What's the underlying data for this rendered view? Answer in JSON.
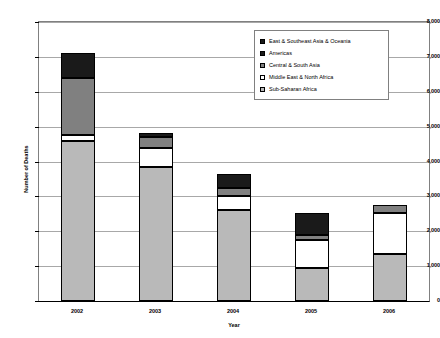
{
  "chart_data": {
    "type": "bar",
    "subtype": "stacked-vertical-bar",
    "title": "",
    "xlabel": "Year",
    "ylabel": "Number of Deaths",
    "categories": [
      "2002",
      "2003",
      "2004",
      "2005",
      "2006"
    ],
    "ylim": [
      0,
      8000
    ],
    "ytick_values": [
      0,
      1000,
      2000,
      3000,
      4000,
      5000,
      6000,
      7000,
      8000
    ],
    "ytick_labels": [
      "0",
      "1,000",
      "2,000",
      "3,000",
      "4,000",
      "5,000",
      "6,000",
      "7,000",
      "8,000"
    ],
    "grid": true,
    "grid_axis": "y",
    "legend_position": "inside-top-right",
    "stack_order_bottom_to_top": [
      "Sub-Saharan Africa",
      "Middle East & North Africa",
      "Central & South Asia",
      "Americas",
      "East & Southeast Asia & Oceania"
    ],
    "series": [
      {
        "name": "East & Southeast Asia & Oceania",
        "fill": "black",
        "values": [
          700,
          120,
          400,
          620,
          0
        ]
      },
      {
        "name": "Americas",
        "fill": "black",
        "values": [
          0,
          0,
          0,
          0,
          0
        ]
      },
      {
        "name": "Central & South Asia",
        "fill": "gray",
        "values": [
          1650,
          300,
          250,
          140,
          220
        ]
      },
      {
        "name": "Middle East & North Africa",
        "fill": "white",
        "values": [
          170,
          560,
          400,
          810,
          1170
        ]
      },
      {
        "name": "Sub-Saharan Africa",
        "fill": "speckle",
        "values": [
          4580,
          3840,
          2600,
          950,
          1350
        ]
      }
    ],
    "totals": [
      7100,
      4820,
      3650,
      2520,
      2740
    ]
  },
  "legend": {
    "items": [
      {
        "label": "East & Southeast Asia & Oceania",
        "fill": "black"
      },
      {
        "label": "Americas",
        "fill": "black"
      },
      {
        "label": "Central & South Asia",
        "fill": "gray"
      },
      {
        "label": "Middle East & North Africa",
        "fill": "white"
      },
      {
        "label": "Sub-Saharan Africa",
        "fill": "speckle"
      }
    ]
  },
  "colors": {
    "black": "#1a1a1a",
    "gray": "#808080",
    "white": "#ffffff",
    "speckle_base": "#b9b9b9",
    "gridline": "#a8a8a8",
    "axis": "#000000",
    "plot_border": "#808080"
  }
}
